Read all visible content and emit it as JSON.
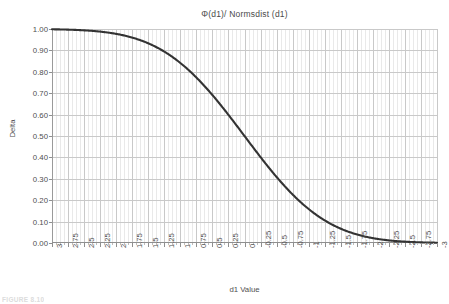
{
  "chart_data": {
    "type": "line",
    "title": "Φ(d1)/ Normsdist (d1)",
    "xlabel": "d1 Value",
    "ylabel": "Delta",
    "grid": true,
    "legend": false,
    "legend_position": "none",
    "xlim": [
      3,
      -3
    ],
    "ylim": [
      0.0,
      1.0
    ],
    "x_axis_reversed": true,
    "x_tick_step": 0.25,
    "y_tick_step": 0.1,
    "x_minor_gridlines_per_major": 3,
    "series_color": "#333333",
    "series_line_width": 2,
    "grid_color_major": "#c9c9c9",
    "grid_color_minor": "#e9e9e9",
    "axis_color": "#8f8f8f",
    "xticklabels": [
      "3",
      "2.75",
      "2.5",
      "2.25",
      "2",
      "1.75",
      "1.5",
      "1.25",
      "1",
      "0.75",
      "0.5",
      "0.25",
      "0",
      "-0.25",
      "-0.5",
      "-0.75",
      "-1",
      "-1.25",
      "-1.5",
      "-1.75",
      "-2",
      "-2.25",
      "-2.5",
      "-2.75",
      "-3"
    ],
    "yticklabels": [
      "1.00",
      "0.90",
      "0.80",
      "0.70",
      "0.60",
      "0.50",
      "0.40",
      "0.30",
      "0.20",
      "0.10",
      "0.00"
    ],
    "series": [
      {
        "name": "Φ(d1)",
        "x": [
          3,
          2.75,
          2.5,
          2.25,
          2,
          1.75,
          1.5,
          1.25,
          1,
          0.75,
          0.5,
          0.25,
          0,
          -0.25,
          -0.5,
          -0.75,
          -1,
          -1.25,
          -1.5,
          -1.75,
          -2,
          -2.25,
          -2.5,
          -2.75,
          -3
        ],
        "values": [
          0.9987,
          0.997,
          0.9938,
          0.9878,
          0.9772,
          0.9599,
          0.9332,
          0.8944,
          0.8413,
          0.7734,
          0.6915,
          0.5987,
          0.5,
          0.4013,
          0.3085,
          0.2266,
          0.1587,
          0.1056,
          0.0668,
          0.0401,
          0.0228,
          0.0122,
          0.0062,
          0.003,
          0.0013
        ]
      }
    ]
  },
  "caption": {
    "text": "FIGURE 8.10"
  }
}
